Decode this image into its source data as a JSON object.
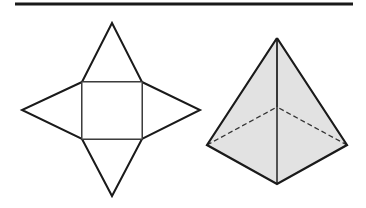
{
  "diagram": {
    "colors": {
      "stroke": "#1a1a1a",
      "fill_pyramid": "#e2e2e2",
      "background": "#ffffff"
    },
    "top_rule": {
      "x1": 15,
      "y1": 4,
      "x2": 353,
      "y2": 4
    },
    "net": {
      "square": {
        "x": 82,
        "y": 82,
        "w": 60,
        "h": 57
      },
      "triangles": {
        "top": "82,82 112,23 142,82",
        "right": "142,82 200,110 142,139",
        "bottom": "82,139 112,196 142,139",
        "left": "82,82 22,110 82,139"
      }
    },
    "pyramid": {
      "apex": [
        277,
        38
      ],
      "base_left": [
        207,
        145
      ],
      "base_front": [
        277,
        184
      ],
      "base_right": [
        347,
        145
      ],
      "base_back": [
        277,
        107
      ]
    }
  }
}
